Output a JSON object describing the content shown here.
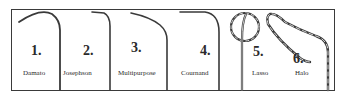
{
  "figure": {
    "items": [
      {
        "number": "1.",
        "name": "Damato"
      },
      {
        "number": "2.",
        "name": "Josephson"
      },
      {
        "number": "3.",
        "name": "Multipurpose"
      },
      {
        "number": "4.",
        "name": "Cournand"
      },
      {
        "number": "5.",
        "name": "Lasso"
      },
      {
        "number": "6.",
        "name": "Halo"
      }
    ]
  }
}
